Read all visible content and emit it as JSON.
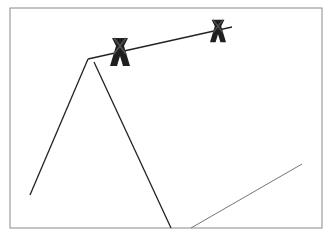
{
  "diagram": {
    "frame": {
      "x": 10,
      "y": 8,
      "width": 312,
      "height": 220,
      "stroke": "#8a8a8a"
    },
    "lines": {
      "left_slope": {
        "x1": 30,
        "y1": 195,
        "x2": 88,
        "y2": 59,
        "stroke": "#222222"
      },
      "ridge": {
        "x1": 88,
        "y1": 59,
        "x2": 232,
        "y2": 27,
        "stroke": "#222222"
      },
      "right_slope": {
        "x1": 94,
        "y1": 62,
        "x2": 171,
        "y2": 228,
        "stroke": "#222222"
      },
      "lower_edge": {
        "x1": 191,
        "y1": 228,
        "x2": 302,
        "y2": 164,
        "stroke": "#666666"
      }
    },
    "clips": [
      {
        "cx": 120,
        "cy": 52,
        "scale": 1.0,
        "color": "#1f1f1f"
      },
      {
        "cx": 218,
        "cy": 31,
        "scale": 0.8,
        "color": "#1f1f1f"
      }
    ]
  }
}
